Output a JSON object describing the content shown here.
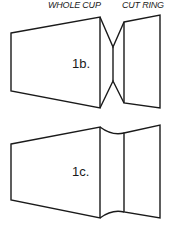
{
  "labels": {
    "whole_cup": "WHOLE CUP",
    "cut_ring": "CUT RING"
  },
  "figures": [
    {
      "id": "1b",
      "label": "1b.",
      "description": "Whole cup and cut ring joined by a pinched V-shaped neck"
    },
    {
      "id": "1c",
      "label": "1c.",
      "description": "Whole cup and cut ring joined by a slightly curved waist"
    }
  ],
  "colors": {
    "stroke": "#1a1a1a",
    "background": "#ffffff"
  }
}
